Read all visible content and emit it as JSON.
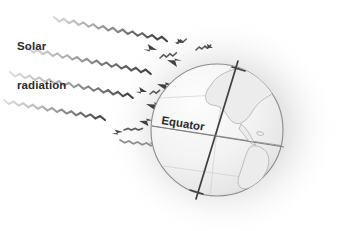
{
  "figure": {
    "name": "solar-radiation-earth-diagram",
    "background_color": "#ffffff",
    "width": 340,
    "height": 231
  },
  "labels": {
    "solar_radiation_line1": "Solar",
    "solar_radiation_line2": "radiation",
    "equator": "Equator"
  },
  "colors": {
    "ray_dark": "#4a4a4a",
    "ray_mid": "#8a8a8a",
    "ray_light": "#c9c9c9",
    "glow": "#9a9a9a",
    "globe_fill": "#f4f4f4",
    "globe_outline": "#8c8c8c",
    "continent_outline": "#b4b4b4",
    "axis": "#4a4a4a",
    "text": "#2b2b2b"
  },
  "globe": {
    "center_x": 217,
    "center_y": 130,
    "radius": 66,
    "axis_tilt_degrees": 23.5,
    "equator_label_rotation_degrees": -13
  },
  "rays": {
    "incoming_count": 5,
    "reflected_count": 5,
    "direction": "upper-left to lower-right",
    "style": "wavy"
  }
}
